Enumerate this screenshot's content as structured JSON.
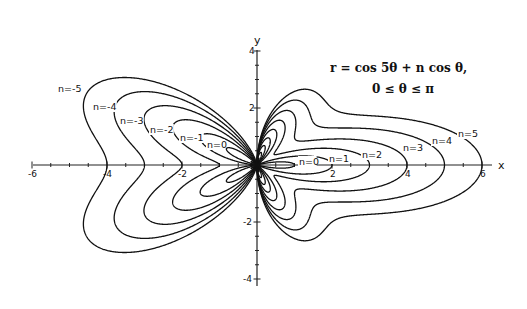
{
  "chart_data": {
    "type": "line",
    "subtype": "polar-curves",
    "title": "r = cos 5θ + n cos θ,",
    "subtitle": "0 ≤ θ ≤ π",
    "equation": "r = cos(5*theta) + n*cos(theta)",
    "theta_range": [
      0,
      3.14159
    ],
    "xlabel": "x",
    "ylabel": "y",
    "xlim": [
      -6,
      6
    ],
    "ylim": [
      -4,
      4
    ],
    "x_ticks_labeled": [
      -6,
      -4,
      -2,
      2,
      4,
      6
    ],
    "y_ticks_labeled": [
      4,
      2,
      -2,
      -4
    ],
    "x_tick_labels": [
      "-6",
      "-4",
      "-2",
      "2",
      "4",
      "6"
    ],
    "y_tick_labels": [
      "4",
      "2",
      "-2",
      "-4"
    ],
    "grid": false,
    "legend": "inline curve labels",
    "series": [
      {
        "name": "n=-5",
        "n": -5
      },
      {
        "name": "n=-4",
        "n": -4
      },
      {
        "name": "n=-3",
        "n": -3
      },
      {
        "name": "n=-2",
        "n": -2
      },
      {
        "name": "n=-1",
        "n": -1
      },
      {
        "name": "n=0",
        "n": 0
      },
      {
        "name": "n=1",
        "n": 1
      },
      {
        "name": "n=2",
        "n": 2
      },
      {
        "name": "n=3",
        "n": 3
      },
      {
        "name": "n=4",
        "n": 4
      },
      {
        "name": "n=5",
        "n": 5
      }
    ],
    "curve_labels_left": [
      {
        "text": "n=-5",
        "x": 58,
        "y": 92
      },
      {
        "text": "n=-4",
        "x": 93,
        "y": 110
      },
      {
        "text": "n=-3",
        "x": 120,
        "y": 124
      },
      {
        "text": "n=-2",
        "x": 150,
        "y": 133
      },
      {
        "text": "n=-1",
        "x": 180,
        "y": 141
      },
      {
        "text": "n=0",
        "x": 207,
        "y": 148
      }
    ],
    "curve_labels_right": [
      {
        "text": "n=0",
        "x": 299,
        "y": 165
      },
      {
        "text": "n=1",
        "x": 329,
        "y": 162
      },
      {
        "text": "n=2",
        "x": 362,
        "y": 158
      },
      {
        "text": "n=3",
        "x": 403,
        "y": 151
      },
      {
        "text": "n=4",
        "x": 432,
        "y": 144
      },
      {
        "text": "n=5",
        "x": 458,
        "y": 137
      }
    ]
  },
  "plot": {
    "origin_px": [
      257,
      165
    ],
    "x_unit_px": 37.5,
    "y_unit_px": 28.5,
    "x_axis_px": [
      33,
      492
    ],
    "y_axis_px": [
      50,
      286
    ]
  }
}
